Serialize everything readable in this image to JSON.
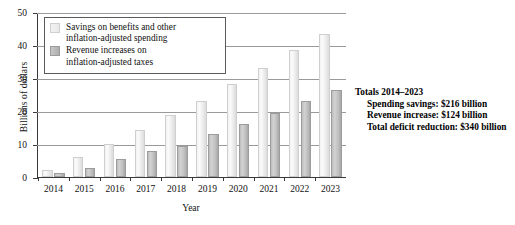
{
  "chart_data": {
    "type": "bar",
    "title": "",
    "xlabel": "Year",
    "ylabel": "Billions of dollars",
    "ylim": [
      0,
      50
    ],
    "yticks": [
      0,
      10,
      20,
      30,
      40,
      50
    ],
    "grid": true,
    "legend_position": "top-left",
    "categories": [
      "2014",
      "2015",
      "2016",
      "2017",
      "2018",
      "2019",
      "2020",
      "2021",
      "2022",
      "2023"
    ],
    "series": [
      {
        "name": "Savings on benefits and other inflation-adjusted spending",
        "values": [
          2.0,
          6.0,
          10.0,
          14.3,
          18.7,
          23.0,
          28.2,
          33.0,
          38.4,
          43.3
        ]
      },
      {
        "name": "Revenue increases on inflation-adjusted taxes",
        "values": [
          1.2,
          2.6,
          5.5,
          7.8,
          9.4,
          13.1,
          16.0,
          19.5,
          23.0,
          26.5
        ]
      }
    ],
    "annotations": [
      "Totals 2014–2023",
      "Spending savings: $216 billion",
      "Revenue increase: $124 billion",
      "Total deficit reduction: $340 billion"
    ]
  },
  "axes": {
    "ylabel": "Billions of dollars",
    "xlabel": "Year",
    "yticks": [
      "0",
      "10",
      "20",
      "30",
      "40",
      "50"
    ],
    "xticks": [
      "2014",
      "2015",
      "2016",
      "2017",
      "2018",
      "2019",
      "2020",
      "2021",
      "2022",
      "2023"
    ]
  },
  "legend": {
    "items": [
      {
        "swatch": "savings",
        "line1": "Savings on benefits and other",
        "line2": "inflation-adjusted spending"
      },
      {
        "swatch": "revenue",
        "line1": "Revenue increases on",
        "line2": "inflation-adjusted taxes"
      }
    ]
  },
  "totals": {
    "heading": "Totals 2014–2023",
    "lines": [
      "Spending savings: $216 billion",
      "Revenue increase: $124 billion",
      "Total deficit reduction: $340 billion"
    ]
  },
  "colors": {
    "savings_bar": "#ededed",
    "revenue_bar": "#c2c2c2",
    "axis": "#3a3a3a",
    "gridline": "#9a9a9a",
    "text": "#111111"
  }
}
